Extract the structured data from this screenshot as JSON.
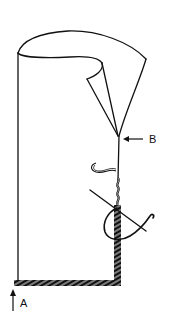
{
  "diagram": {
    "type": "sewing-illustration",
    "labels": {
      "a": "A",
      "b": "B"
    },
    "colors": {
      "ink": "#111111",
      "background": "#ffffff"
    }
  }
}
